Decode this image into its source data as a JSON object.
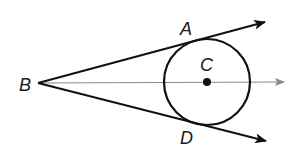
{
  "diagram": {
    "type": "geometry",
    "colors": {
      "stroke": "#111111",
      "axis_ray": "#8a8a8a",
      "background": "#ffffff"
    },
    "points": {
      "B": {
        "label": "B",
        "x": 38,
        "y": 83
      },
      "A": {
        "label": "A",
        "x": 198,
        "y": 41
      },
      "C": {
        "label": "C",
        "x": 207,
        "y": 82
      },
      "D": {
        "label": "D",
        "x": 198,
        "y": 124
      }
    },
    "circle": {
      "center": "C",
      "cx": 207,
      "cy": 82,
      "r": 43
    },
    "rays": [
      {
        "name": "ray-BA",
        "from": "B",
        "through": "A",
        "tip": [
          265,
          22
        ]
      },
      {
        "name": "ray-BD",
        "from": "B",
        "through": "D",
        "tip": [
          266,
          141
        ]
      },
      {
        "name": "ray-BC",
        "from": "B",
        "through": "C",
        "tip": [
          284,
          82
        ]
      }
    ],
    "labels": {
      "A": "A",
      "B": "B",
      "C": "C",
      "D": "D"
    }
  }
}
